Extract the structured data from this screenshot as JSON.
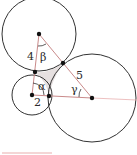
{
  "diagram": {
    "type": "tangent-circles-triangle",
    "circles": [
      {
        "name": "top",
        "center": [
          39,
          34
        ],
        "radius": 37
      },
      {
        "name": "small",
        "center": [
          32,
          95
        ],
        "radius": 20
      },
      {
        "name": "large",
        "center": [
          92,
          98
        ],
        "radius": 44
      }
    ],
    "tangent_points": [
      [
        35,
        72
      ],
      [
        63,
        63
      ],
      [
        49,
        96
      ]
    ],
    "labels": {
      "side_top": "4",
      "side_small": "2",
      "side_large": "5",
      "angle_small": "α",
      "angle_top": "β",
      "angle_large": "γ"
    },
    "colors": {
      "circle_stroke": "#333333",
      "triangle_stroke": "#c98a8a",
      "shaded_region": "#e6e0e0",
      "point": "#111111"
    }
  }
}
